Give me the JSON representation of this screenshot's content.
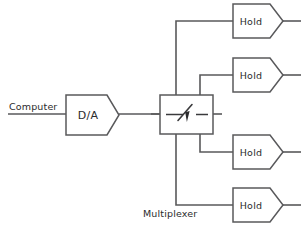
{
  "diagram": {
    "canvas": {
      "width": 307,
      "height": 226
    },
    "colors": {
      "background": "#ffffff",
      "wire": "#59595b",
      "outline": "#59595b",
      "text": "#2b2b2d"
    },
    "labels": {
      "source": "Computer",
      "converter": "D/A",
      "multiplexer": "Multiplexer"
    },
    "blocks": {
      "converter": {
        "label": "D/A",
        "x": 66,
        "y": 95,
        "body_width": 41,
        "height": 40,
        "tip_x": 119
      },
      "multiplexer": {
        "label": "Multiplexer",
        "x": 160,
        "y": 95,
        "width": 53,
        "height": 39
      },
      "holds": [
        {
          "label": "Hold",
          "center_y": 21
        },
        {
          "label": "Hold",
          "center_y": 75
        },
        {
          "label": "Hold",
          "center_y": 152
        },
        {
          "label": "Hold",
          "center_y": 205
        }
      ],
      "hold_geometry": {
        "x": 233,
        "body_width": 37,
        "height": 34,
        "tip_x": 283,
        "input_x": 222,
        "output_x": 301
      }
    },
    "wires": {
      "input_line": {
        "x1": 8,
        "x2": 66,
        "y": 114
      },
      "converter_to_mux": {
        "x1": 119,
        "x2": 160,
        "y": 114
      },
      "mux_left_stub": {
        "x1": 151,
        "x2": 160,
        "y": 114
      },
      "mux_right_stub": {
        "x1": 213,
        "x2": 222,
        "y": 114
      },
      "riser_left_x": 176,
      "riser_right_x": 200,
      "mux_top_y": 95,
      "mux_bottom_y": 134,
      "label_line_y": 205
    }
  }
}
